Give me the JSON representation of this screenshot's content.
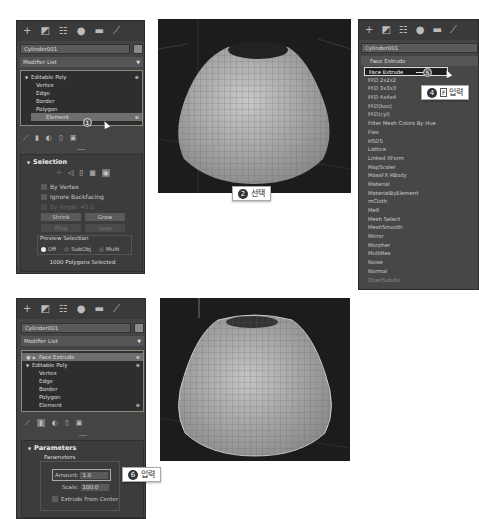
{
  "command_panel_icons": [
    "create-icon",
    "modify-icon",
    "hierarchy-icon",
    "motion-icon",
    "display-icon",
    "utilities-icon"
  ],
  "command_panel_glyphs": [
    "+",
    "◩",
    "☷",
    "●",
    "▬",
    "⟋"
  ],
  "panel1": {
    "object_name": "Cylinder001",
    "modifier_list": "Modifier List",
    "stack": [
      {
        "label": "Editable Poly",
        "level": 0,
        "expand": "▼"
      },
      {
        "label": "Vertex",
        "level": 1
      },
      {
        "label": "Edge",
        "level": 1
      },
      {
        "label": "Border",
        "level": 1
      },
      {
        "label": "Polygon",
        "level": 1
      },
      {
        "label": "Element",
        "level": 1,
        "selected": true
      }
    ],
    "step_badge": "1",
    "selection": {
      "title": "Selection",
      "by_vertex": "By Vertex",
      "ignore_backfacing": "Ignore Backfacing",
      "by_angle": "By Angle:",
      "by_angle_value": "45.0",
      "shrink": "Shrink",
      "grow": "Grow",
      "ring": "Ring",
      "loop": "Loop",
      "preview_selection": "Preview Selection",
      "radio": [
        "Off",
        "SubObj",
        "Multi"
      ],
      "status": "1000 Polygons Selected"
    }
  },
  "callout2": {
    "num": "2",
    "text": "선택"
  },
  "panel3": {
    "object_name": "Cylinder001",
    "dropdown_value": "Face Extrude",
    "step_badge": "5",
    "items": [
      "Face Extrude",
      "FFD 2x2x2",
      "FFD 3x3x3",
      "FFD 4x4x4",
      "FFD(box)",
      "FFD(cyl)",
      "Filter Mesh Colors By Hue",
      "Flex",
      "HSDS",
      "Lattice",
      "Linked XForm",
      "MapScaler",
      "MassFX RBody",
      "Material",
      "MaterialByElement",
      "mCloth",
      "Melt",
      "Mesh Select",
      "MeshSmooth",
      "Mirror",
      "Morpher",
      "MultiRes",
      "Noise",
      "Normal",
      "OpenSubdiv"
    ]
  },
  "callout4": {
    "num": "4",
    "key": "F",
    "text": "입력"
  },
  "panel5": {
    "object_name": "Cylinder001",
    "modifier_list": "Modifier List",
    "stack": [
      {
        "label": "Face Extrude",
        "level": 0,
        "selected": true
      },
      {
        "label": "Editable Poly",
        "level": 0,
        "expand": "▼"
      },
      {
        "label": "Vertex",
        "level": 1
      },
      {
        "label": "Edge",
        "level": 1
      },
      {
        "label": "Border",
        "level": 1
      },
      {
        "label": "Polygon",
        "level": 1
      },
      {
        "label": "Element",
        "level": 1
      }
    ],
    "parameters": {
      "title": "Parameters",
      "group": "Parameters",
      "amount_label": "Amount:",
      "amount_value": "1.0",
      "scale_label": "Scale:",
      "scale_value": "100.0",
      "extrude_from_center": "Extrude From Center"
    }
  },
  "callout6": {
    "num": "6",
    "text": "입력"
  }
}
